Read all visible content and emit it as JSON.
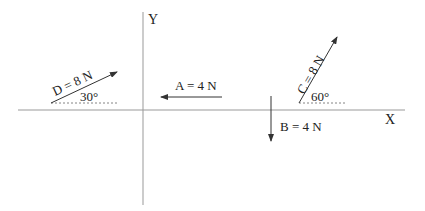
{
  "axes": {
    "x_label": "X",
    "y_label": "Y"
  },
  "vectors": [
    {
      "name": "A",
      "label": "A = 4 N",
      "magnitude_N": 4,
      "direction": "negative x"
    },
    {
      "name": "B",
      "label": "B = 4 N",
      "magnitude_N": 4,
      "direction": "negative y"
    },
    {
      "name": "C",
      "label": "C = 8 N",
      "magnitude_N": 8,
      "angle_label": "60°",
      "angle_deg": 60
    },
    {
      "name": "D",
      "label": "D = 8 N",
      "magnitude_N": 8,
      "angle_label": "30°",
      "angle_deg": 30
    }
  ],
  "colors": {
    "axis": "#999999",
    "vector": "#333333",
    "text": "#222222"
  }
}
